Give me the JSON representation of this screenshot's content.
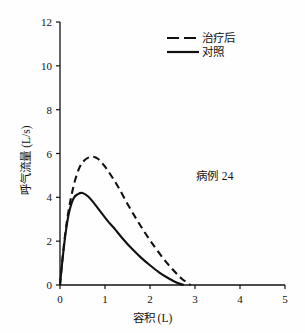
{
  "chart_data": {
    "type": "line",
    "title": "",
    "xlabel": "容积 (L)",
    "ylabel": "呼气流量 (L/s)",
    "xlim": [
      0,
      5
    ],
    "ylim": [
      0,
      12
    ],
    "xticks": [
      "0",
      "1",
      "2",
      "3",
      "4",
      "5"
    ],
    "yticks": [
      "0",
      "2",
      "4",
      "6",
      "8",
      "10",
      "12"
    ],
    "xtick_values": [
      0,
      1,
      2,
      3,
      4,
      5
    ],
    "ytick_values": [
      0,
      2,
      4,
      6,
      8,
      10,
      12
    ],
    "grid": false,
    "legend_position": "top-right",
    "annotation": "病例 24",
    "series": [
      {
        "name": "治疗后",
        "style": "dashed",
        "color": "#111111",
        "peak_x": 0.7,
        "peak_y": 5.85,
        "end_x": 2.9,
        "x": [
          0,
          0.05,
          0.12,
          0.2,
          0.3,
          0.42,
          0.55,
          0.7,
          0.85,
          1.0,
          1.15,
          1.3,
          1.5,
          1.7,
          1.9,
          2.1,
          2.3,
          2.5,
          2.7,
          2.9
        ],
        "y": [
          0,
          1.1,
          2.4,
          3.5,
          4.5,
          5.3,
          5.7,
          5.85,
          5.75,
          5.4,
          4.95,
          4.45,
          3.7,
          3.0,
          2.35,
          1.75,
          1.2,
          0.72,
          0.3,
          0
        ]
      },
      {
        "name": "对照",
        "style": "solid",
        "color": "#111111",
        "peak_x": 0.5,
        "peak_y": 4.2,
        "end_x": 2.75,
        "x": [
          0,
          0.05,
          0.12,
          0.2,
          0.3,
          0.4,
          0.5,
          0.62,
          0.75,
          0.9,
          1.05,
          1.2,
          1.4,
          1.6,
          1.8,
          2.0,
          2.2,
          2.4,
          2.6,
          2.75
        ],
        "y": [
          0,
          1.05,
          2.3,
          3.3,
          3.95,
          4.15,
          4.2,
          4.05,
          3.75,
          3.35,
          2.95,
          2.6,
          2.1,
          1.65,
          1.25,
          0.9,
          0.58,
          0.32,
          0.1,
          0
        ]
      }
    ]
  },
  "legend": {
    "items": [
      {
        "label": "治疗后",
        "style": "dashed"
      },
      {
        "label": "对照",
        "style": "solid"
      }
    ]
  },
  "axes": {
    "x_title": "容积 (L)",
    "y_title": "呼气流量 (L/s)"
  },
  "annotation": {
    "text": "病例 24"
  }
}
